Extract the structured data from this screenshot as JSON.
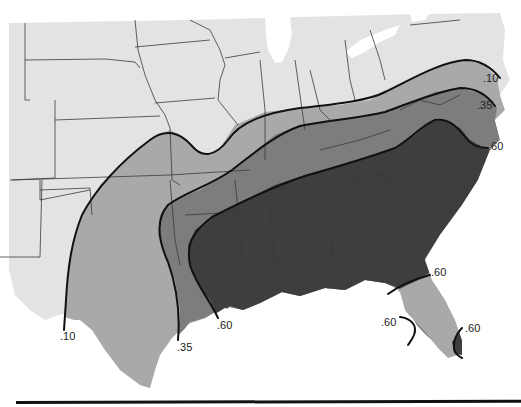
{
  "map": {
    "type": "contour-map",
    "region": "Southeastern and Central United States",
    "colors": {
      "background_land": "#e3e3e3",
      "zone_010": "#a9a9a9",
      "zone_035": "#7d7d7d",
      "zone_060": "#3e3e3e",
      "water": "#ffffff",
      "state_border": "#3a3a3a",
      "contour_line": "#111111"
    },
    "contours": [
      {
        "value": ".10",
        "label_positions": [
          {
            "x": 506,
            "y": 80
          },
          {
            "x": 60,
            "y": 334
          }
        ]
      },
      {
        "value": ".35",
        "label_positions": [
          {
            "x": 496,
            "y": 107
          },
          {
            "x": 178,
            "y": 345
          }
        ]
      },
      {
        "value": ".60",
        "label_positions": [
          {
            "x": 487,
            "y": 148
          },
          {
            "x": 218,
            "y": 323
          },
          {
            "x": 432,
            "y": 273
          },
          {
            "x": 381,
            "y": 318
          },
          {
            "x": 465,
            "y": 326
          }
        ]
      }
    ],
    "labels": {
      "c010_ne": ".10",
      "c035_ne": ".35",
      "c060_ne": ".60",
      "c010_sw": ".10",
      "c035_sw": ".35",
      "c060_gulf": ".60",
      "c060_fl_north": ".60",
      "c060_fl_west": ".60",
      "c060_fl_east": ".60"
    }
  }
}
